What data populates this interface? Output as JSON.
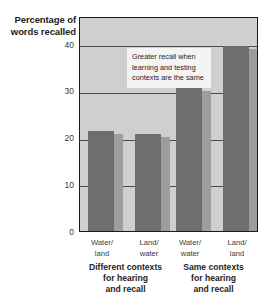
{
  "chart_data": {
    "type": "bar",
    "title": "",
    "ylabel": "Percentage of words recalled",
    "xlabel": "",
    "categories": [
      "Water/ land",
      "Land/ water",
      "Water/ water",
      "Land/ land"
    ],
    "categories_lines": [
      [
        "Water/",
        "land"
      ],
      [
        "Land/",
        "water"
      ],
      [
        "Water/",
        "water"
      ],
      [
        "Land/",
        "land"
      ]
    ],
    "values": [
      21.5,
      20.8,
      30.5,
      39.5
    ],
    "ylim": [
      0,
      46
    ],
    "yticks": [
      0,
      10,
      20,
      30,
      40
    ],
    "ytick_labels": [
      "0",
      "10",
      "20",
      "30",
      "40"
    ],
    "grid": true,
    "legend": "none",
    "annotations": [
      {
        "text": "Greater recall when learning and testing contexts are the same",
        "lines": [
          "Greater recall when",
          "learning and testing",
          "contexts are the same"
        ]
      }
    ],
    "groups": [
      {
        "label_lines": [
          "Different contexts",
          "for hearing",
          "and recall"
        ]
      },
      {
        "label_lines": [
          "Same contexts",
          "for hearing",
          "and recall"
        ]
      }
    ],
    "colors": {
      "bar": "#6e6e6e",
      "bar_shadow": "#9d9d9d",
      "plot_background": "#cfcfcf",
      "axis": "#1b1b1b",
      "gridline": "#4a4a4a",
      "annotation_background": "#f4f4f4",
      "page_background": "#ffffff"
    }
  },
  "y_axis_title": {
    "line1": "Percentage of",
    "line2": "words recalled"
  }
}
